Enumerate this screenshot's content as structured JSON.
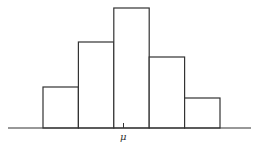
{
  "chart_data": {
    "type": "bar",
    "title": "",
    "xlabel": "",
    "ylabel": "",
    "categories": [
      "1",
      "2",
      "3",
      "4",
      "5"
    ],
    "values": [
      41,
      86,
      120,
      71,
      30
    ],
    "x_tick_labels": [
      {
        "label": "μ",
        "position": "center"
      }
    ],
    "grid": false,
    "legend": null,
    "style": {
      "fill": "#ffffff",
      "stroke": "#333333",
      "bar_gap": 0
    }
  },
  "axis": {
    "mean_label": "μ"
  },
  "colors": {
    "stroke": "#333333",
    "background": "#ffffff"
  }
}
